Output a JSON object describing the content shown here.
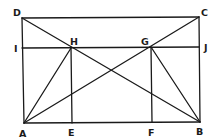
{
  "diagram": {
    "type": "geometric-construction",
    "points": {
      "A": {
        "x": 24,
        "y": 123
      },
      "B": {
        "x": 200,
        "y": 122
      },
      "C": {
        "x": 199,
        "y": 17
      },
      "D": {
        "x": 22,
        "y": 18
      },
      "E": {
        "x": 72,
        "y": 123
      },
      "F": {
        "x": 152,
        "y": 122
      },
      "G": {
        "x": 151,
        "y": 47
      },
      "H": {
        "x": 71,
        "y": 48
      },
      "I": {
        "x": 22,
        "y": 48
      },
      "J": {
        "x": 199,
        "y": 47
      }
    },
    "segments": [
      [
        "D",
        "C"
      ],
      [
        "D",
        "A"
      ],
      [
        "C",
        "B"
      ],
      [
        "A",
        "B"
      ],
      [
        "I",
        "J"
      ],
      [
        "D",
        "B"
      ],
      [
        "A",
        "C"
      ],
      [
        "A",
        "H"
      ],
      [
        "H",
        "E"
      ],
      [
        "G",
        "F"
      ],
      [
        "G",
        "B"
      ]
    ],
    "labels": [
      {
        "text": "D",
        "x": 13,
        "y": 16
      },
      {
        "text": "C",
        "x": 201,
        "y": 16
      },
      {
        "text": "I",
        "x": 14,
        "y": 52
      },
      {
        "text": "H",
        "x": 70,
        "y": 45
      },
      {
        "text": "G",
        "x": 141,
        "y": 45
      },
      {
        "text": "J",
        "x": 204,
        "y": 51
      },
      {
        "text": "A",
        "x": 19,
        "y": 137
      },
      {
        "text": "E",
        "x": 68,
        "y": 136
      },
      {
        "text": "F",
        "x": 148,
        "y": 136
      },
      {
        "text": "B",
        "x": 196,
        "y": 135
      }
    ]
  }
}
